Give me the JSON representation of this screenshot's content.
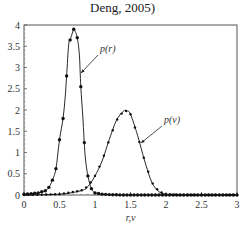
{
  "caption": "Deng, 2005)",
  "chart_data": {
    "type": "line",
    "title": "",
    "xlabel": "r,v",
    "ylabel": "",
    "xlim": [
      0,
      3
    ],
    "ylim": [
      0,
      4
    ],
    "xticks": [
      "0",
      "0.5",
      "1",
      "1.5",
      "2",
      "2.5",
      "3"
    ],
    "yticks": [
      "0",
      "0.5",
      "1",
      "1.5",
      "2",
      "2.5",
      "3",
      "3.5",
      "4"
    ],
    "grid": false,
    "series": [
      {
        "name": "p(r)",
        "annotation": "p(r)",
        "x": [
          0.0,
          0.1,
          0.2,
          0.3,
          0.35,
          0.4,
          0.45,
          0.5,
          0.55,
          0.58,
          0.6,
          0.63,
          0.66,
          0.7,
          0.72,
          0.75,
          0.78,
          0.8,
          0.83,
          0.86,
          0.9,
          0.95,
          1.0,
          1.1,
          1.2,
          1.4,
          1.6,
          2.0,
          2.5,
          3.0
        ],
        "values": [
          0.02,
          0.03,
          0.05,
          0.1,
          0.18,
          0.35,
          0.62,
          1.3,
          1.8,
          2.3,
          2.8,
          3.55,
          3.7,
          3.9,
          3.85,
          3.7,
          3.3,
          2.55,
          1.8,
          0.95,
          0.45,
          0.15,
          0.05,
          0.02,
          0.01,
          0.0,
          0.0,
          0.0,
          0.0,
          0.0
        ]
      },
      {
        "name": "p(v)",
        "annotation": "p(v)",
        "x": [
          0.0,
          0.5,
          0.8,
          0.9,
          1.0,
          1.1,
          1.2,
          1.3,
          1.4,
          1.45,
          1.5,
          1.6,
          1.7,
          1.8,
          1.9,
          2.0,
          2.2,
          2.5,
          3.0
        ],
        "values": [
          0.0,
          0.02,
          0.1,
          0.2,
          0.45,
          0.8,
          1.3,
          1.75,
          1.97,
          1.98,
          1.9,
          1.4,
          0.8,
          0.3,
          0.08,
          0.02,
          0.0,
          0.0,
          0.0
        ]
      }
    ],
    "legend": "inline annotations with arrows"
  }
}
